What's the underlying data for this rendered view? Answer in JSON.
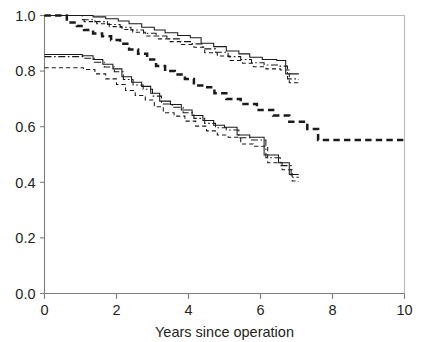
{
  "chart_data": {
    "type": "line",
    "title": "",
    "subtitle": "",
    "xlabel": "Years since operation",
    "ylabel": "",
    "xlim": [
      0,
      10
    ],
    "ylim": [
      0.0,
      1.0
    ],
    "xticks": [
      0,
      2,
      4,
      6,
      8,
      10
    ],
    "xtick_labels": [
      "0",
      "2",
      "4",
      "6",
      "8",
      "10"
    ],
    "yticks": [
      0.0,
      0.2,
      0.4,
      0.6,
      0.8,
      1.0
    ],
    "ytick_labels": [
      "0.0",
      "0.2",
      "0.4",
      "0.6",
      "0.8",
      "1.0"
    ],
    "grid": false,
    "legend": "none",
    "step_interpolation": "post",
    "series": [
      {
        "name": "upper-group-solid",
        "style": "solid",
        "linewidth": 1.05,
        "color": "#1a1a1a",
        "x": [
          0.0,
          0.95,
          1.35,
          1.7,
          2.05,
          2.35,
          2.7,
          3.05,
          3.35,
          3.7,
          4.05,
          4.35,
          4.7,
          5.05,
          5.4,
          5.7,
          6.05,
          6.45,
          6.7,
          7.05
        ],
        "y": [
          1.0,
          1.0,
          0.995,
          0.988,
          0.98,
          0.97,
          0.958,
          0.948,
          0.938,
          0.928,
          0.92,
          0.9,
          0.888,
          0.872,
          0.862,
          0.85,
          0.842,
          0.838,
          0.79,
          0.788
        ]
      },
      {
        "name": "upper-group-dashdot",
        "style": "dashdot",
        "linewidth": 1.05,
        "color": "#1a1a1a",
        "x": [
          0.0,
          1.05,
          1.4,
          1.75,
          2.1,
          2.4,
          2.75,
          3.1,
          3.4,
          3.75,
          4.1,
          4.4,
          4.75,
          5.1,
          5.45,
          5.75,
          6.1,
          6.5,
          6.75,
          7.05
        ],
        "y": [
          1.0,
          0.985,
          0.978,
          0.968,
          0.958,
          0.948,
          0.936,
          0.926,
          0.916,
          0.906,
          0.898,
          0.88,
          0.868,
          0.852,
          0.842,
          0.83,
          0.822,
          0.818,
          0.772,
          0.77
        ]
      },
      {
        "name": "upper-group-dashed",
        "style": "dashed",
        "linewidth": 1.05,
        "color": "#1a1a1a",
        "x": [
          0.0,
          1.1,
          1.45,
          1.8,
          2.15,
          2.45,
          2.8,
          3.15,
          3.45,
          3.8,
          4.15,
          4.45,
          4.8,
          5.15,
          5.5,
          5.8,
          6.15,
          6.55,
          6.8,
          7.05
        ],
        "y": [
          1.0,
          0.978,
          0.97,
          0.96,
          0.95,
          0.94,
          0.926,
          0.916,
          0.906,
          0.896,
          0.886,
          0.866,
          0.854,
          0.838,
          0.828,
          0.816,
          0.808,
          0.804,
          0.758,
          0.756
        ]
      },
      {
        "name": "middle-bold-dashed",
        "style": "bold-dashed",
        "linewidth": 2.5,
        "color": "#1a1a1a",
        "x": [
          0.0,
          0.42,
          0.62,
          0.9,
          1.1,
          1.35,
          1.6,
          1.85,
          2.1,
          2.35,
          2.6,
          2.85,
          3.1,
          3.35,
          3.62,
          3.9,
          4.15,
          4.42,
          4.72,
          5.05,
          5.45,
          5.9,
          6.35,
          6.8,
          7.3,
          7.6,
          10.0
        ],
        "y": [
          1.0,
          1.0,
          0.975,
          0.962,
          0.948,
          0.935,
          0.925,
          0.912,
          0.898,
          0.878,
          0.862,
          0.842,
          0.818,
          0.8,
          0.788,
          0.772,
          0.748,
          0.742,
          0.72,
          0.7,
          0.682,
          0.66,
          0.64,
          0.618,
          0.592,
          0.552,
          0.552
        ]
      },
      {
        "name": "lower-group-solid",
        "style": "solid",
        "linewidth": 1.05,
        "color": "#1a1a1a",
        "x": [
          0.0,
          1.05,
          1.35,
          1.62,
          1.9,
          2.15,
          2.42,
          2.7,
          2.95,
          3.2,
          3.5,
          3.8,
          4.1,
          4.4,
          4.7,
          5.0,
          5.35,
          5.7,
          6.1,
          6.5,
          6.8,
          7.05
        ],
        "y": [
          0.86,
          0.855,
          0.842,
          0.825,
          0.808,
          0.78,
          0.76,
          0.745,
          0.72,
          0.692,
          0.68,
          0.66,
          0.64,
          0.622,
          0.605,
          0.598,
          0.57,
          0.562,
          0.498,
          0.47,
          0.428,
          0.426
        ]
      },
      {
        "name": "lower-group-dashdot",
        "style": "dashdot",
        "linewidth": 1.05,
        "color": "#1a1a1a",
        "x": [
          0.0,
          1.08,
          1.38,
          1.66,
          1.94,
          2.19,
          2.46,
          2.74,
          3.0,
          3.25,
          3.55,
          3.85,
          4.15,
          4.45,
          4.75,
          5.05,
          5.4,
          5.75,
          6.15,
          6.55,
          6.85,
          7.05
        ],
        "y": [
          0.852,
          0.846,
          0.832,
          0.815,
          0.798,
          0.77,
          0.75,
          0.735,
          0.71,
          0.682,
          0.67,
          0.65,
          0.63,
          0.612,
          0.596,
          0.588,
          0.56,
          0.552,
          0.488,
          0.46,
          0.418,
          0.416
        ]
      },
      {
        "name": "lower-group-dashed",
        "style": "dashed",
        "linewidth": 1.05,
        "color": "#1a1a1a",
        "x": [
          0.0,
          1.08,
          1.4,
          1.7,
          2.0,
          2.25,
          2.52,
          2.8,
          3.05,
          3.3,
          3.6,
          3.9,
          4.2,
          4.5,
          4.8,
          5.1,
          5.45,
          5.8,
          6.2,
          6.6,
          6.88,
          7.05
        ],
        "y": [
          0.812,
          0.806,
          0.79,
          0.772,
          0.752,
          0.73,
          0.712,
          0.696,
          0.672,
          0.65,
          0.638,
          0.62,
          0.602,
          0.585,
          0.57,
          0.562,
          0.538,
          0.53,
          0.47,
          0.445,
          0.405,
          0.402
        ]
      }
    ],
    "annotations": []
  },
  "figure": {
    "background_color": "#ffffff",
    "axis_color": "#7d7d7d",
    "frame_color": "#b9b9b9",
    "curve_color": "#1a1a1a",
    "text_color": "#231f20"
  }
}
